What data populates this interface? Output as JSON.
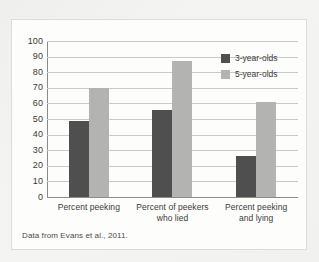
{
  "chart_data": {
    "type": "bar",
    "title": "",
    "subtitle": "",
    "xlabel": "",
    "ylabel": "",
    "ylim": [
      0,
      100
    ],
    "ytick_labels": [
      "100",
      "90",
      "80",
      "70",
      "60",
      "50",
      "40",
      "30",
      "20",
      "10",
      "0"
    ],
    "ytick_values": [
      100,
      90,
      80,
      70,
      60,
      50,
      40,
      30,
      20,
      10,
      0
    ],
    "grid": true,
    "legend_position": "top-right",
    "categories": [
      "Percent peeking",
      "Percent of peekers who lied",
      "Percent peeking and lying"
    ],
    "category_lines": [
      [
        "Percent peeking"
      ],
      [
        "Percent of peekers",
        "who lied"
      ],
      [
        "Percent peeking",
        "and lying"
      ]
    ],
    "series": [
      {
        "name": "3-year-olds",
        "color": "#4f4f4f",
        "values": [
          49,
          56,
          26
        ]
      },
      {
        "name": "5-year-olds",
        "color": "#b3b3b1",
        "values": [
          70,
          87,
          61
        ]
      }
    ],
    "source_note": "Data from Evans et al., 2011."
  },
  "colors": {
    "series_3_year_olds": "#4f4f4f",
    "series_5_year_olds": "#b3b3b1",
    "axis": "#8b8b88",
    "gridline": "#c9c9c6",
    "panel_background": "#fdfdfc",
    "page_background": "#f2f2f1",
    "text": "#3a3a38"
  }
}
